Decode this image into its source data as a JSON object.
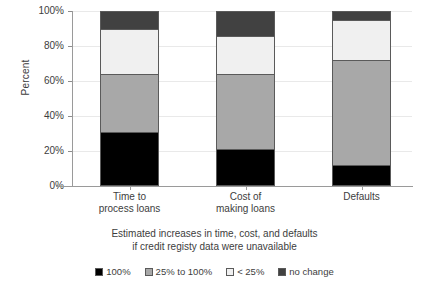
{
  "chart_data": {
    "type": "bar",
    "subtype": "stacked-100-percent",
    "title": "",
    "xlabel_line1": "Estimated increases in time, cost, and defaults",
    "xlabel_line2": "if credit registy data were unavailable",
    "ylabel": "Percent",
    "ylim": [
      0,
      100
    ],
    "ytick_labels": [
      "100%",
      "80%",
      "60%",
      "40%",
      "20%",
      "0%"
    ],
    "ytick_values": [
      100,
      80,
      60,
      40,
      20,
      0
    ],
    "grid": true,
    "legend_position": "bottom",
    "categories": [
      "Time to process loans",
      "Cost of making loans",
      "Defaults"
    ],
    "category_lines": [
      {
        "l1": "Time to",
        "l2": "process loans"
      },
      {
        "l1": "Cost of",
        "l2": "making loans"
      },
      {
        "l1": "Defaults",
        "l2": ""
      }
    ],
    "series": [
      {
        "name": "100%",
        "color": "#000000",
        "values": [
          31,
          21,
          12
        ]
      },
      {
        "name": "25% to 100%",
        "color": "#a8a8a8",
        "values": [
          33,
          43,
          60
        ]
      },
      {
        "name": "< 25%",
        "color": "#f0f0f0",
        "values": [
          26,
          22,
          23
        ]
      },
      {
        "name": "no change",
        "color": "#414141",
        "values": [
          10,
          14,
          5
        ]
      }
    ]
  },
  "legend": {
    "items": [
      {
        "label": "100%",
        "color": "#000000"
      },
      {
        "label": "25% to 100%",
        "color": "#a8a8a8"
      },
      {
        "label": "< 25%",
        "color": "#f0f0f0"
      },
      {
        "label": "no change",
        "color": "#414141"
      }
    ]
  },
  "axes": {
    "y_title": "Percent",
    "x_title_line1": "Estimated increases in time, cost, and defaults",
    "x_title_line2": "if credit registy data were unavailable"
  }
}
